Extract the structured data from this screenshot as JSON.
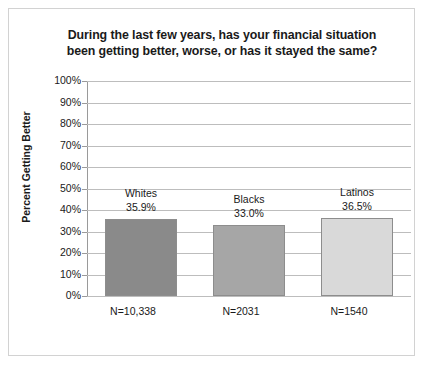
{
  "chart_data": {
    "type": "bar",
    "title": "During the last few years, has your financial situation been getting better, worse, or has it stayed the same?",
    "title_line1": "During the last few years, has your financial situation",
    "title_line2": "been getting better, worse, or has it stayed the same?",
    "xlabel": "",
    "ylabel": "Percent Getting Better",
    "ylim": [
      0,
      100
    ],
    "grid": true,
    "legend": "none",
    "ytick_labels": [
      "100%",
      "90%",
      "80%",
      "70%",
      "60%",
      "50%",
      "40%",
      "30%",
      "20%",
      "10%",
      "0%"
    ],
    "ytick_values": [
      100,
      90,
      80,
      70,
      60,
      50,
      40,
      30,
      20,
      10,
      0
    ],
    "categories": [
      "Whites",
      "Blacks",
      "Latinos"
    ],
    "values": [
      35.9,
      33.0,
      36.5
    ],
    "value_labels": [
      "35.9%",
      "33.0%",
      "36.5%"
    ],
    "xtick_labels": [
      "N=10,338",
      "N=2031",
      "N=1540"
    ],
    "sample_sizes": [
      10338,
      2031,
      1540
    ],
    "bar_colors": [
      "#8a8a8a",
      "#a6a6a6",
      "#d9d9d9"
    ],
    "bar_border_color": "#8d8d8d",
    "gridline_color": "#bdbdbd",
    "axis_color": "#9a9a9a",
    "text_color": "#1a1a1a",
    "background_color": "#ffffff",
    "border_color": "#d2d2d2"
  }
}
